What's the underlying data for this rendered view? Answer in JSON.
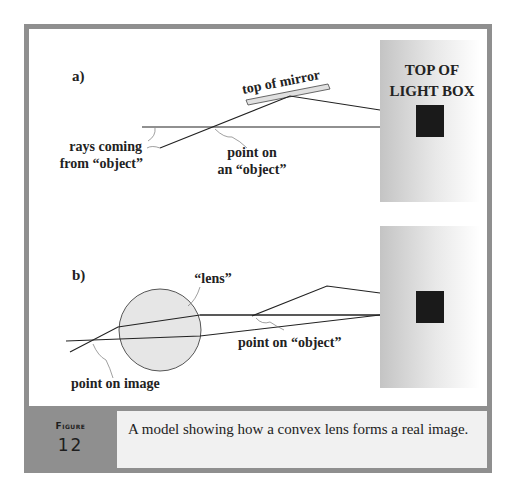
{
  "figure": {
    "label_word": "Figure",
    "number": "12",
    "caption": "A model showing how a convex lens forms a real image."
  },
  "panel_a": {
    "tag": "a)",
    "mirror_label": "top of mirror",
    "lightbox_label_line1": "TOP OF",
    "lightbox_label_line2": "LIGHT BOX",
    "rays_label_line1": "rays coming",
    "rays_label_line2": "from “object”",
    "point_label_line1": "point on",
    "point_label_line2": "an “object”"
  },
  "panel_b": {
    "tag": "b)",
    "lens_label": "“lens”",
    "object_point_label": "point on “object”",
    "image_point_label": "point on image"
  },
  "colors": {
    "frame": "#8f8f8f",
    "caption_bg": "#f1f1f1",
    "lens_fill": "#e6e6e6",
    "mirror_fill": "#e0e0e0",
    "object_square": "#1a1a1a"
  }
}
